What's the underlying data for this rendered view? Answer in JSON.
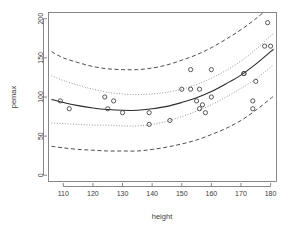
{
  "chart_data": {
    "type": "scatter",
    "title": "",
    "xlabel": "height",
    "ylabel": "pemax",
    "xlim": [
      105,
      182
    ],
    "ylim": [
      -8,
      208
    ],
    "xticks": [
      110,
      120,
      130,
      140,
      150,
      160,
      170,
      180
    ],
    "yticks": [
      0,
      50,
      100,
      150,
      200
    ],
    "grid": false,
    "legend": "none",
    "x": [
      109,
      112,
      124,
      125,
      127,
      130,
      139,
      139,
      146,
      150,
      153,
      153,
      155,
      156,
      156,
      157,
      158,
      160,
      160,
      171,
      171,
      174,
      174,
      175,
      178,
      179,
      180
    ],
    "y": [
      95,
      85,
      100,
      85,
      95,
      80,
      65,
      80,
      70,
      110,
      135,
      110,
      95,
      110,
      85,
      90,
      80,
      135,
      100,
      130,
      130,
      95,
      85,
      120,
      165,
      195,
      165
    ],
    "series": [
      {
        "name": "observations",
        "type": "scatter",
        "marker": "open-circle"
      },
      {
        "name": "quadratic-fit",
        "type": "line",
        "style": "solid"
      },
      {
        "name": "confidence-band-upper",
        "type": "line",
        "style": "dotted"
      },
      {
        "name": "confidence-band-lower",
        "type": "line",
        "style": "dotted"
      },
      {
        "name": "prediction-band-upper",
        "type": "line",
        "style": "dashed"
      },
      {
        "name": "prediction-band-lower",
        "type": "line",
        "style": "dashed"
      }
    ],
    "fit_curve": {
      "x": [
        106,
        110,
        115,
        120,
        125,
        130,
        135,
        140,
        145,
        150,
        155,
        160,
        165,
        170,
        175,
        180,
        181
      ],
      "y": [
        97,
        93,
        89,
        86,
        84,
        83,
        83,
        85,
        88,
        93,
        99,
        107,
        117,
        128,
        142,
        158,
        161
      ]
    },
    "ci_upper": {
      "x": [
        106,
        110,
        115,
        120,
        125,
        130,
        135,
        140,
        145,
        150,
        155,
        160,
        165,
        170,
        175,
        180,
        181
      ],
      "y": [
        127,
        121,
        115,
        110,
        106,
        104,
        103,
        104,
        106,
        110,
        116,
        124,
        134,
        146,
        161,
        178,
        181
      ]
    },
    "ci_lower": {
      "x": [
        106,
        110,
        115,
        120,
        125,
        130,
        135,
        140,
        145,
        150,
        155,
        160,
        165,
        170,
        175,
        180,
        181
      ],
      "y": [
        67,
        66,
        65,
        64,
        64,
        63,
        63,
        65,
        69,
        75,
        82,
        90,
        100,
        111,
        123,
        138,
        141
      ]
    },
    "pi_upper": {
      "x": [
        106,
        110,
        115,
        120,
        125,
        130,
        135,
        140,
        145,
        150,
        155,
        160,
        165,
        170,
        175,
        180,
        181
      ],
      "y": [
        158,
        150,
        144,
        139,
        136,
        135,
        135,
        137,
        141,
        147,
        154,
        163,
        174,
        186,
        200,
        216,
        219
      ]
    },
    "pi_lower": {
      "x": [
        106,
        110,
        115,
        120,
        125,
        130,
        135,
        140,
        145,
        150,
        155,
        160,
        165,
        170,
        175,
        180,
        181
      ],
      "y": [
        37,
        35,
        33,
        32,
        31,
        31,
        31,
        33,
        36,
        40,
        45,
        52,
        60,
        70,
        83,
        98,
        101
      ]
    }
  }
}
